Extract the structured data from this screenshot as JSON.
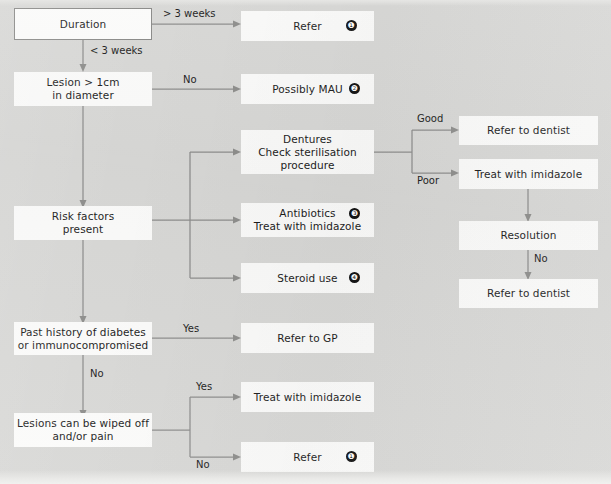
{
  "diagram": {
    "background_color": "#d8d8d6",
    "node_color": "#fbfbfa",
    "line_color": "#8e8e8c",
    "text_color": "#1c1c1c"
  },
  "nodes": {
    "duration": "Duration",
    "refer_top": "Refer",
    "lesion_size": "Lesion > 1cm\nin diameter",
    "possibly_mau": "Possibly MAU",
    "dentures": "Dentures\nCheck sterilisation\nprocedure",
    "risk_factors": "Risk factors\npresent",
    "antibiotics": "Antibiotics\nTreat with imidazole",
    "steroid_use": "Steroid use",
    "refer_dentist_good": "Refer to dentist",
    "treat_imidazole_poor": "Treat with imidazole",
    "resolution": "Resolution",
    "refer_dentist_final": "Refer to dentist",
    "past_history": "Past history of diabetes\nor immunocompromised",
    "refer_gp": "Refer to GP",
    "lesions_wiped": "Lesions can be wiped off\nand/or pain",
    "treat_imidazole_yes": "Treat with imidazole",
    "refer_bottom": "Refer"
  },
  "badges": {
    "refer_top": "❶",
    "possibly_mau": "❷",
    "antibiotics": "❸",
    "steroid_use": "❹",
    "refer_bottom": "❶"
  },
  "edge_labels": {
    "gt_3_weeks": "> 3 weeks",
    "lt_3_weeks": "< 3 weeks",
    "lesion_no": "No",
    "good": "Good",
    "poor": "Poor",
    "resolution_no": "No",
    "past_history_yes": "Yes",
    "past_history_no": "No",
    "wiped_yes": "Yes",
    "wiped_no": "No"
  }
}
